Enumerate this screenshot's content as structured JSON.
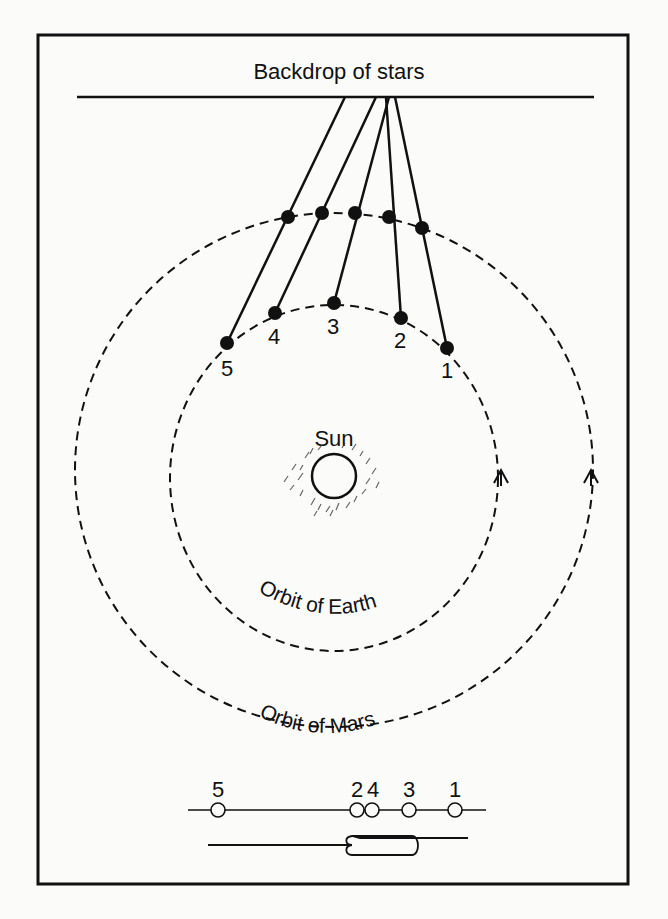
{
  "diagram": {
    "backdrop_label": "Backdrop of stars",
    "sun_label": "Sun",
    "earth_orbit_label": "Orbit of Earth",
    "mars_orbit_label": "Orbit of Mars",
    "colors": {
      "ink": "#111111",
      "background": "#fbfbfa"
    },
    "positions": [
      {
        "label": "1",
        "earth": [
          447,
          348
        ],
        "mars": [
          422,
          228
        ]
      },
      {
        "label": "2",
        "earth": [
          401,
          318
        ],
        "mars": [
          389,
          217
        ]
      },
      {
        "label": "3",
        "earth": [
          334,
          303
        ],
        "mars": [
          355,
          213
        ]
      },
      {
        "label": "4",
        "earth": [
          275,
          313
        ],
        "mars": [
          322,
          213
        ]
      },
      {
        "label": "5",
        "earth": [
          227,
          343
        ],
        "mars": [
          288,
          217
        ]
      }
    ],
    "apparent_positions": {
      "labels": [
        "5",
        "2",
        "4",
        "3",
        "1"
      ],
      "x": [
        218,
        358,
        373,
        409,
        455
      ]
    },
    "direction_markers": [
      "orbit-arrow-earth",
      "orbit-arrow-mars"
    ]
  }
}
